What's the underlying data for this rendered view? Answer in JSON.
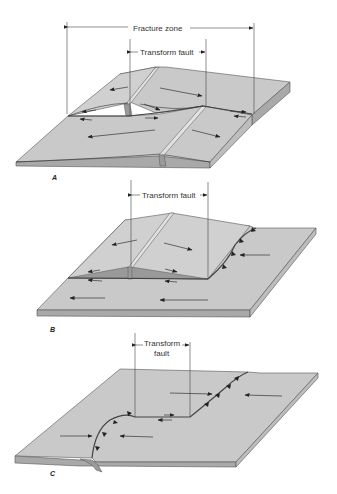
{
  "figure": {
    "panels": [
      {
        "id": "A",
        "label": "A",
        "annotations": {
          "outer_dimension": "Fracture zone",
          "inner_dimension": "Transform fault"
        }
      },
      {
        "id": "B",
        "label": "B",
        "annotations": {
          "inner_dimension": "Transform fault"
        }
      },
      {
        "id": "C",
        "label": "C",
        "annotations": {
          "inner_dimension_line1": "Transform",
          "inner_dimension_line2": "fault"
        }
      }
    ]
  },
  "colors": {
    "plate_top": "#c9c9c9",
    "plate_side": "#a9a9a9",
    "outline": "#555555",
    "text": "#333333",
    "background": "#ffffff"
  }
}
